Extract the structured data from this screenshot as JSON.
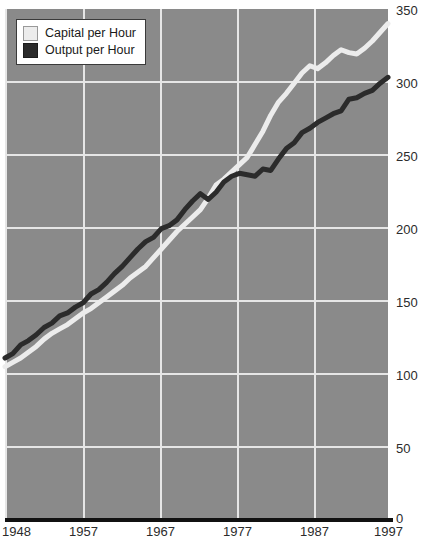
{
  "chart_data": {
    "type": "line",
    "title": "",
    "subtitle": "",
    "xlabel": "",
    "ylabel": "",
    "grid": true,
    "legend_position": "top-left",
    "xlim": [
      1948,
      1997
    ],
    "ylim": [
      0,
      350
    ],
    "x_ticks": [
      "1948",
      "1957",
      "1967",
      "1977",
      "1987",
      "1997"
    ],
    "y_ticks": [
      "0",
      "50",
      "100",
      "150",
      "200",
      "250",
      "300",
      "350"
    ],
    "x": [
      1948,
      1949,
      1950,
      1951,
      1952,
      1953,
      1954,
      1955,
      1956,
      1957,
      1958,
      1959,
      1960,
      1961,
      1962,
      1963,
      1964,
      1965,
      1966,
      1967,
      1968,
      1969,
      1970,
      1971,
      1972,
      1973,
      1974,
      1975,
      1976,
      1977,
      1978,
      1979,
      1980,
      1981,
      1982,
      1983,
      1984,
      1985,
      1986,
      1987,
      1988,
      1989,
      1990,
      1991,
      1992,
      1993,
      1994,
      1995,
      1996,
      1997
    ],
    "series": [
      {
        "name": "Capital per Hour",
        "color": "#ececec",
        "values": [
          104,
          107,
          110,
          114,
          118,
          123,
          127,
          130,
          133,
          137,
          141,
          144,
          148,
          152,
          156,
          160,
          165,
          169,
          173,
          179,
          185,
          191,
          197,
          202,
          207,
          212,
          220,
          229,
          233,
          238,
          243,
          248,
          257,
          266,
          277,
          286,
          292,
          299,
          306,
          311,
          309,
          313,
          318,
          322,
          320,
          319,
          323,
          328,
          334,
          340
        ]
      },
      {
        "name": "Output per Hour",
        "color": "#2b2b2b",
        "values": [
          110,
          113,
          119,
          122,
          126,
          131,
          134,
          139,
          141,
          145,
          148,
          154,
          157,
          162,
          168,
          173,
          179,
          185,
          190,
          193,
          199,
          201,
          205,
          212,
          218,
          223,
          219,
          224,
          231,
          235,
          237,
          236,
          235,
          240,
          239,
          247,
          254,
          258,
          265,
          268,
          272,
          275,
          278,
          280,
          288,
          289,
          292,
          294,
          299,
          303
        ]
      }
    ]
  },
  "legend": {
    "items": [
      {
        "label": "Capital per Hour",
        "color": "#ececec"
      },
      {
        "label": "Output per Hour",
        "color": "#2b2b2b"
      }
    ]
  },
  "axes": {
    "y_labels": [
      "350",
      "300",
      "250",
      "200",
      "150",
      "100",
      "50",
      "0"
    ],
    "x_labels": [
      "1948",
      "1957",
      "1967",
      "1977",
      "1987",
      "1997"
    ]
  },
  "colors": {
    "plot_background": "#8a8a8a",
    "gridline": "#e6e6e6",
    "baseline": "#111111",
    "capital_line": "#ececec",
    "output_line": "#2b2b2b",
    "text": "#2b2b2b"
  }
}
